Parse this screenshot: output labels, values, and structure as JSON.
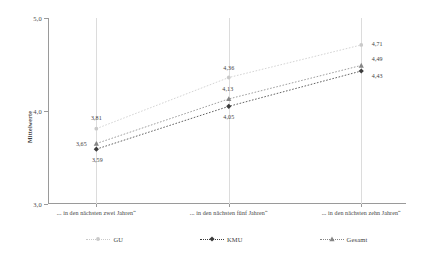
{
  "chart_data": {
    "type": "line",
    "title": "",
    "subtitle": "",
    "xlabel": "",
    "ylabel": "Mittelwerte",
    "ylim": [
      3.0,
      5.0
    ],
    "yticks": [
      "3,0",
      "4,0",
      "5,0"
    ],
    "ytick_values": [
      3.0,
      4.0,
      5.0
    ],
    "grid": "vertical",
    "legend_position": "bottom",
    "categories": [
      "... in den nächsten zwei Jahren“",
      "... in den nächsten fünf Jahren“",
      "... in den nächsten zehn Jahren“"
    ],
    "series": [
      {
        "name": "GU",
        "marker": "open-circle-light",
        "color": "#c9c9c9",
        "values": [
          3.81,
          4.36,
          4.71
        ],
        "labels": [
          "3,81",
          "4,36",
          "4,71"
        ]
      },
      {
        "name": "KMU",
        "marker": "filled-diamond-dark",
        "color": "#3c3c3c",
        "values": [
          3.59,
          4.05,
          4.43
        ],
        "labels": [
          "3,59",
          "4,05",
          "4,43"
        ]
      },
      {
        "name": "Gesamt",
        "marker": "filled-triangle-gray",
        "color": "#868686",
        "values": [
          3.65,
          4.13,
          4.49
        ],
        "labels": [
          "3,65",
          "4,13",
          "4,49"
        ]
      }
    ]
  },
  "axis": {
    "y_title": "Mittelwerte",
    "y_ticks": [
      {
        "label": "5,0",
        "value": 5.0
      },
      {
        "label": "4,0",
        "value": 4.0
      },
      {
        "label": "3,0",
        "value": 3.0
      }
    ],
    "x_categories": [
      "... in den nächsten zwei Jahren“",
      "... in den nächsten fünf Jahren“",
      "... in den nächsten zehn Jahren“"
    ]
  },
  "legend": {
    "items": [
      {
        "label": "GU",
        "marker": "open-circle-light",
        "color": "#c9c9c9"
      },
      {
        "label": "KMU",
        "marker": "filled-diamond-dark",
        "color": "#3c3c3c"
      },
      {
        "label": "Gesamt",
        "marker": "filled-triangle-gray",
        "color": "#868686"
      }
    ]
  },
  "colors": {
    "gu": "#c9c9c9",
    "kmu": "#3c3c3c",
    "gesamt": "#868686",
    "axis": "#9a9a9a",
    "grid": "#dcdcdc",
    "text": "#3d3d3d",
    "background": "#ffffff"
  }
}
